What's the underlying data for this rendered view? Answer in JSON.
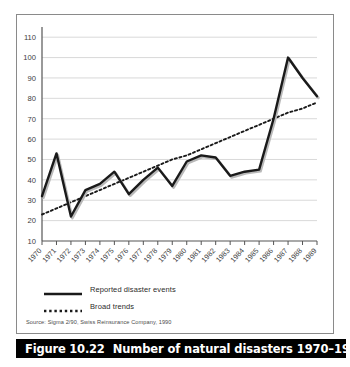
{
  "figure": {
    "caption_number": "Figure 10.22",
    "caption_title": "Number of natural disasters 1970–1989",
    "source_note": "Source: Sigma 2/90, Swiss Reinsurance Company, 1990"
  },
  "legend": {
    "items": [
      {
        "label": "Reported disaster events",
        "style": "solid",
        "color": "#1a1a1a"
      },
      {
        "label": "Broad trends",
        "style": "dotted",
        "color": "#1a1a1a"
      }
    ]
  },
  "colors": {
    "series_line": "#1a1a1a",
    "trend_line": "#1a1a1a",
    "gridline": "#cfcfcf",
    "axis": "#555555",
    "panel_border": "#8a8a8a",
    "caption_bar_bg": "#000000",
    "caption_text": "#ffffff",
    "background": "#ffffff"
  },
  "chart_data": {
    "type": "line",
    "title": "Number of natural disasters 1970–1989",
    "xlabel": "",
    "ylabel": "",
    "grid": true,
    "legend_position": "below-plot-left",
    "xlim": [
      1970,
      1989
    ],
    "ylim": [
      10,
      115
    ],
    "ytick_labels": [
      "10",
      "20",
      "30",
      "40",
      "50",
      "60",
      "70",
      "80",
      "90",
      "100",
      "110"
    ],
    "yticks": [
      10,
      20,
      30,
      40,
      50,
      60,
      70,
      80,
      90,
      100,
      110
    ],
    "x": [
      1970,
      1971,
      1972,
      1973,
      1974,
      1975,
      1976,
      1977,
      1978,
      1979,
      1980,
      1981,
      1982,
      1983,
      1984,
      1985,
      1986,
      1987,
      1988,
      1989
    ],
    "xtick_labels": [
      "1970",
      "1971",
      "1972",
      "1973",
      "1974",
      "1975",
      "1976",
      "1977",
      "1978",
      "1979",
      "1980",
      "1981",
      "1982",
      "1983",
      "1984",
      "1985",
      "1986",
      "1987",
      "1988",
      "1989"
    ],
    "series": [
      {
        "name": "Reported disaster events",
        "style": "solid",
        "values": [
          32,
          53,
          22,
          35,
          38,
          44,
          33,
          40,
          46,
          37,
          49,
          52,
          51,
          42,
          44,
          45,
          70,
          100,
          90,
          81
        ]
      },
      {
        "name": "Broad trends",
        "style": "dotted",
        "values": [
          23,
          26,
          29,
          32,
          35,
          38,
          41,
          44,
          47,
          50,
          52,
          55,
          58,
          61,
          64,
          67,
          70,
          73,
          75,
          78
        ]
      }
    ]
  }
}
